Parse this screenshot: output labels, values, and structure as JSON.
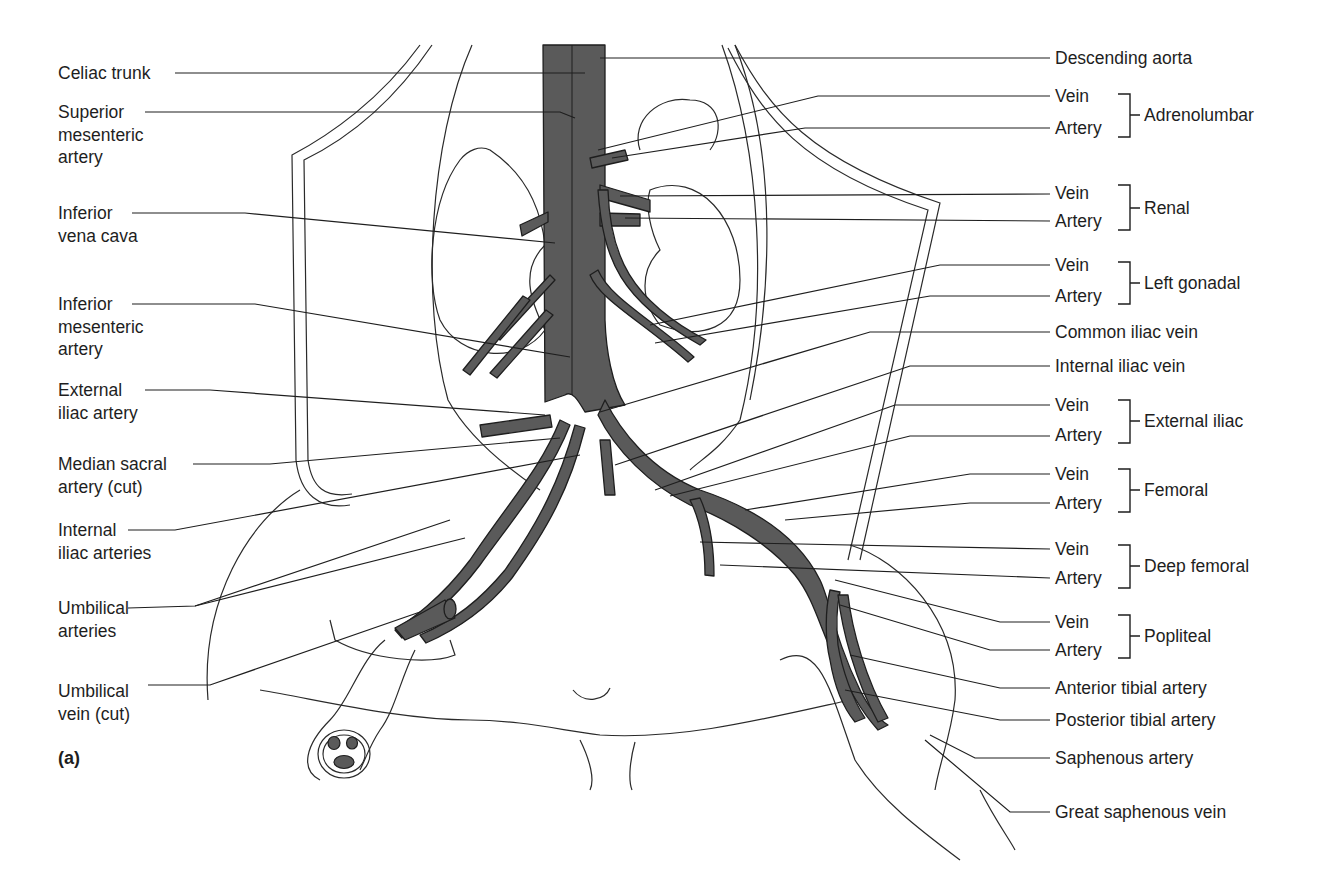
{
  "figure": {
    "panel_label": "(a)",
    "vessel_color": "#5a5a5a",
    "line_color": "#1e1e1e",
    "background": "#ffffff"
  },
  "left_labels": [
    {
      "id": "celiac-trunk",
      "lines": [
        "Celiac trunk"
      ]
    },
    {
      "id": "superior-mesenteric-artery",
      "lines": [
        "Superior",
        "mesenteric",
        "artery"
      ]
    },
    {
      "id": "inferior-vena-cava",
      "lines": [
        "Inferior",
        "vena cava"
      ]
    },
    {
      "id": "inferior-mesenteric-artery",
      "lines": [
        "Inferior",
        "mesenteric",
        "artery"
      ]
    },
    {
      "id": "external-iliac-artery",
      "lines": [
        "External",
        "iliac artery"
      ]
    },
    {
      "id": "median-sacral-artery",
      "lines": [
        "Median sacral",
        "artery (cut)"
      ]
    },
    {
      "id": "internal-iliac-arteries",
      "lines": [
        "Internal",
        "iliac arteries"
      ]
    },
    {
      "id": "umbilical-arteries",
      "lines": [
        "Umbilical",
        "arteries"
      ]
    },
    {
      "id": "umbilical-vein",
      "lines": [
        "Umbilical",
        "vein (cut)"
      ]
    }
  ],
  "right_labels": [
    {
      "id": "descending-aorta",
      "text": "Descending aorta"
    },
    {
      "id": "adrenolumbar-vein",
      "text": "Vein"
    },
    {
      "id": "adrenolumbar-artery",
      "text": "Artery"
    },
    {
      "id": "renal-vein",
      "text": "Vein"
    },
    {
      "id": "renal-artery",
      "text": "Artery"
    },
    {
      "id": "left-gonadal-vein",
      "text": "Vein"
    },
    {
      "id": "left-gonadal-artery",
      "text": "Artery"
    },
    {
      "id": "common-iliac-vein",
      "text": "Common iliac vein"
    },
    {
      "id": "internal-iliac-vein",
      "text": "Internal iliac vein"
    },
    {
      "id": "external-iliac-vein",
      "text": "Vein"
    },
    {
      "id": "external-iliac-artery-r",
      "text": "Artery"
    },
    {
      "id": "femoral-vein",
      "text": "Vein"
    },
    {
      "id": "femoral-artery",
      "text": "Artery"
    },
    {
      "id": "deep-femoral-vein",
      "text": "Vein"
    },
    {
      "id": "deep-femoral-artery",
      "text": "Artery"
    },
    {
      "id": "popliteal-vein",
      "text": "Vein"
    },
    {
      "id": "popliteal-artery",
      "text": "Artery"
    },
    {
      "id": "anterior-tibial-artery",
      "text": "Anterior tibial artery"
    },
    {
      "id": "posterior-tibial-artery",
      "text": "Posterior tibial artery"
    },
    {
      "id": "saphenous-artery",
      "text": "Saphenous artery"
    },
    {
      "id": "great-saphenous-vein",
      "text": "Great saphenous vein"
    }
  ],
  "groups": [
    {
      "id": "adrenolumbar",
      "text": "Adrenolumbar"
    },
    {
      "id": "renal",
      "text": "Renal"
    },
    {
      "id": "left-gonadal",
      "text": "Left gonadal"
    },
    {
      "id": "external-iliac",
      "text": "External iliac"
    },
    {
      "id": "femoral",
      "text": "Femoral"
    },
    {
      "id": "deep-femoral",
      "text": "Deep femoral"
    },
    {
      "id": "popliteal",
      "text": "Popliteal"
    }
  ]
}
